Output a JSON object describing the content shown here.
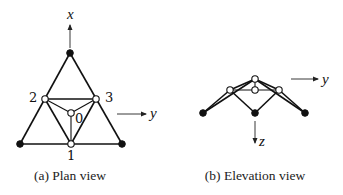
{
  "figure": {
    "panels": [
      {
        "id": "a",
        "caption": "(a) Plan view",
        "axes": {
          "up": "x",
          "right": "y"
        },
        "node_labels": {
          "n0": "0",
          "n1": "1",
          "n2": "2",
          "n3": "3"
        }
      },
      {
        "id": "b",
        "caption": "(b) Elevation view",
        "axes": {
          "right": "y",
          "down": "z"
        }
      }
    ],
    "legend": {
      "filled_node": "support (fixed) node",
      "open_node": "free node"
    }
  }
}
